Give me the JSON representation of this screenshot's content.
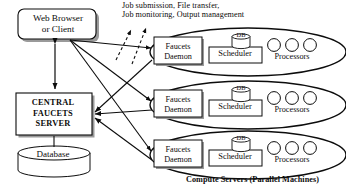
{
  "diagram": {
    "title_top": "Job submission, File transfer,\nJob monitoring, Output management",
    "caption_bottom": "Compute Servers (Parallel Machines)",
    "client": {
      "label": "Web Browser\nor Client"
    },
    "central_server": {
      "label": "CENTRAL\nFAUCETS\nSERVER"
    },
    "database": {
      "label": "Database"
    },
    "compute_servers": [
      {
        "daemon": "Faucets\nDaemon",
        "scheduler": "Scheduler",
        "db": "DB",
        "processors_label": "Processors",
        "processor_count": 3
      },
      {
        "daemon": "Faucets\nDaemon",
        "scheduler": "Scheduler",
        "db": "DB",
        "processors_label": "Processors",
        "processor_count": 3
      },
      {
        "daemon": "Faucets\nDaemon",
        "scheduler": "Scheduler",
        "db": "DB",
        "processors_label": "Processors",
        "processor_count": 3
      }
    ],
    "colors": {
      "stroke": "#0c0c0c",
      "text": "#0c0c0c",
      "background": "#ffffff"
    }
  }
}
